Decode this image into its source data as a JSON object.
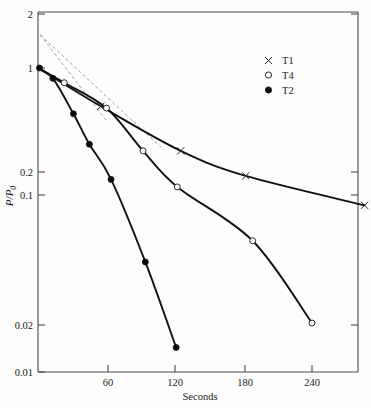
{
  "chart_data": {
    "type": "scatter",
    "title": "",
    "subtitle": "",
    "xlabel": "Seconds",
    "ylabel": "P/P_0",
    "ylabel_display": "P/P",
    "ylabel_subscript": "0",
    "xscale": "linear",
    "yscale": "log",
    "xlim": [
      0,
      286
    ],
    "ylim": [
      0.01,
      2
    ],
    "grid": false,
    "xticks": [
      60,
      120,
      180,
      240
    ],
    "xtick_labels": [
      "60",
      "120",
      "180",
      "240"
    ],
    "yticks": [
      2,
      1,
      0.2,
      0.1,
      0.02,
      0.01
    ],
    "ytick_labels": [
      "2",
      "1",
      "0.2",
      "0.1",
      "0.02",
      "0.01"
    ],
    "legend_position": "upper right",
    "series": [
      {
        "name": "T1",
        "marker": "cross",
        "x": [
          0,
          55,
          125,
          182,
          286
        ],
        "y": [
          1.0,
          0.56,
          0.285,
          0.195,
          0.125
        ]
      },
      {
        "name": "T4",
        "marker": "open-circle",
        "x": [
          0,
          23,
          60,
          92,
          122,
          188,
          240
        ],
        "y": [
          1.0,
          0.8,
          0.545,
          0.285,
          0.165,
          0.073,
          0.021
        ]
      },
      {
        "name": "T2",
        "marker": "filled-circle",
        "x": [
          0,
          13,
          31,
          45,
          64,
          94,
          121
        ],
        "y": [
          1.0,
          0.855,
          0.5,
          0.315,
          0.185,
          0.053,
          0.0145
        ]
      }
    ],
    "annotations": [
      {
        "name": "dashed-extrapolation-1",
        "from": [
          2,
          1.65
        ],
        "to": [
          108,
          0.3
        ]
      },
      {
        "name": "dashed-extrapolation-2",
        "from": [
          2,
          1.65
        ],
        "to": [
          60,
          0.45
        ]
      }
    ]
  },
  "legend": {
    "entries": [
      {
        "label": "T1",
        "marker": "cross"
      },
      {
        "label": "T4",
        "marker": "open-circle"
      },
      {
        "label": "T2",
        "marker": "filled-circle"
      }
    ]
  },
  "axes": {
    "x_title": "Seconds",
    "y_title_main": "P/P",
    "y_title_sub": "0"
  }
}
